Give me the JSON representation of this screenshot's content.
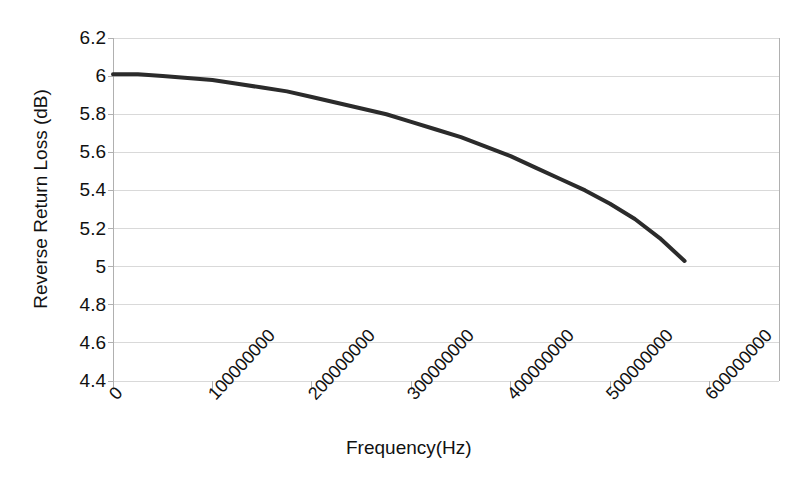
{
  "chart_data": {
    "type": "line",
    "title": "",
    "xlabel": "Frequency(Hz)",
    "ylabel": "Reverse Return Loss (dB)",
    "xlim": [
      0,
      670000000
    ],
    "ylim": [
      4.4,
      6.2
    ],
    "grid": true,
    "legend": null,
    "xticks": [
      0,
      100000000,
      200000000,
      300000000,
      400000000,
      500000000,
      600000000
    ],
    "xtick_labels": [
      "0",
      "100000000",
      "200000000",
      "300000000",
      "400000000",
      "500000000",
      "600000000"
    ],
    "yticks": [
      4.4,
      4.6,
      4.8,
      5,
      5.2,
      5.4,
      5.6,
      5.8,
      6,
      6.2
    ],
    "ytick_labels": [
      "4.4",
      "4.6",
      "4.8",
      "5",
      "5.2",
      "5.4",
      "5.6",
      "5.8",
      "6",
      "6.2"
    ],
    "series": [
      {
        "name": "Reverse Return Loss",
        "color": "#2b2b2b",
        "linewidth": 4,
        "x": [
          0,
          25000000,
          50000000,
          75000000,
          100000000,
          125000000,
          150000000,
          175000000,
          200000000,
          225000000,
          250000000,
          275000000,
          300000000,
          325000000,
          350000000,
          375000000,
          400000000,
          425000000,
          450000000,
          475000000,
          500000000,
          525000000,
          550000000,
          575000000
        ],
        "y": [
          6.01,
          6.01,
          6.0,
          5.99,
          5.98,
          5.96,
          5.94,
          5.92,
          5.89,
          5.86,
          5.83,
          5.8,
          5.76,
          5.72,
          5.68,
          5.63,
          5.58,
          5.52,
          5.46,
          5.4,
          5.33,
          5.25,
          5.15,
          5.03
        ]
      }
    ]
  },
  "axes": {
    "y_title": "Reverse Return Loss (dB)",
    "x_title": "Frequency(Hz)"
  },
  "colors": {
    "line": "#2b2b2b",
    "grid": "#d9d9d9",
    "axis": "#b0b0b0",
    "text": "#111111",
    "background": "#ffffff"
  }
}
